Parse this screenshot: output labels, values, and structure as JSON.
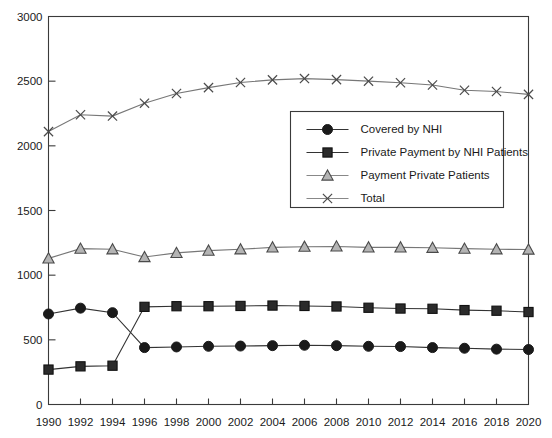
{
  "chart_data": {
    "type": "line",
    "title": "",
    "xlabel": "",
    "ylabel": "",
    "ylim": [
      0,
      3000
    ],
    "y_ticks": [
      0,
      500,
      1000,
      1500,
      2000,
      2500,
      3000
    ],
    "y_tick_labels": [
      "0",
      "500",
      "1000",
      "1500",
      "2000",
      "2500",
      "3000"
    ],
    "grid": false,
    "legend_position": "center-right",
    "categories": [
      1990,
      1992,
      1994,
      1996,
      1998,
      2000,
      2002,
      2004,
      2006,
      2008,
      2010,
      2012,
      2014,
      2016,
      2018,
      2020
    ],
    "x_tick_labels": [
      "1990",
      "1992",
      "1994",
      "1996",
      "1998",
      "2000",
      "2002",
      "2004",
      "2006",
      "2008",
      "2010",
      "2012",
      "2014",
      "2016",
      "2018",
      "2020"
    ],
    "series": [
      {
        "name": "Covered by NHI",
        "marker": "circle",
        "color": "#1a1a1a",
        "values": [
          700,
          745,
          710,
          440,
          445,
          450,
          452,
          455,
          458,
          455,
          450,
          448,
          440,
          435,
          428,
          425
        ]
      },
      {
        "name": "Private Payment by NHI Patients",
        "marker": "square",
        "color": "#2b2b2b",
        "values": [
          270,
          295,
          300,
          755,
          760,
          760,
          762,
          765,
          762,
          758,
          748,
          742,
          740,
          730,
          725,
          715
        ]
      },
      {
        "name": "Payment Private Patients",
        "marker": "triangle",
        "color": "#8c8c8c",
        "values": [
          1130,
          1205,
          1200,
          1140,
          1172,
          1190,
          1200,
          1215,
          1220,
          1222,
          1215,
          1215,
          1212,
          1205,
          1200,
          1198
        ]
      },
      {
        "name": "Total",
        "marker": "x",
        "color": "#4a4a4a",
        "values": [
          2110,
          2240,
          2230,
          2330,
          2405,
          2450,
          2490,
          2510,
          2520,
          2512,
          2500,
          2488,
          2470,
          2430,
          2420,
          2398
        ]
      }
    ]
  },
  "legend": {
    "entries": [
      {
        "label": "Covered by NHI",
        "marker": "circle"
      },
      {
        "label": "Private Payment by NHI Patients",
        "marker": "square"
      },
      {
        "label": "Payment Private Patients",
        "marker": "triangle"
      },
      {
        "label": "Total",
        "marker": "x"
      }
    ]
  },
  "colors": {
    "axis": "#3a3a3a",
    "background": "#ffffff",
    "text": "#1a1a1a"
  }
}
